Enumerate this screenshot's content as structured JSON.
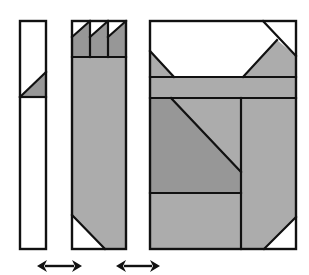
{
  "diagram": {
    "title": "Quilt block assembly diagram",
    "width": 309,
    "height": 275,
    "colors": {
      "background": "#ffffff",
      "outline": "#111111",
      "white_fabric": "#ffffff",
      "light_gray": "#acacac",
      "dark_gray": "#979797",
      "arrow": "#111111"
    },
    "units": [
      {
        "name": "left-strip-unit",
        "outline": [
          20,
          21,
          26,
          228
        ],
        "polygons": [
          {
            "fill": "white_fabric",
            "points": "20,21 46,21 46,72 20,97"
          },
          {
            "fill": "dark_gray",
            "points": "20,97 46,72 46,97"
          },
          {
            "fill": "white_fabric",
            "points": "20,97 46,97 46,249 20,249"
          }
        ],
        "lines": [
          [
            20,
            97,
            46,
            72
          ],
          [
            20,
            97,
            46,
            97
          ]
        ]
      },
      {
        "name": "middle-strip-unit",
        "outline": [
          72,
          21,
          54,
          228
        ],
        "polygons": [
          {
            "fill": "white_fabric",
            "points": "72,21 90,21 72,37"
          },
          {
            "fill": "dark_gray",
            "points": "90,21 90,57 72,57 72,37"
          },
          {
            "fill": "white_fabric",
            "points": "90,21 108,21 90,37"
          },
          {
            "fill": "dark_gray",
            "points": "108,21 108,57 90,57 90,37"
          },
          {
            "fill": "white_fabric",
            "points": "108,21 126,21 108,37"
          },
          {
            "fill": "dark_gray",
            "points": "126,21 126,57 108,57 108,37"
          },
          {
            "fill": "light_gray",
            "points": "72,57 126,57 126,249 105,249 72,215"
          },
          {
            "fill": "white_fabric",
            "points": "72,215 105,249 72,249"
          }
        ],
        "lines": [
          [
            72,
            37,
            90,
            21
          ],
          [
            90,
            37,
            108,
            21
          ],
          [
            108,
            37,
            126,
            21
          ],
          [
            90,
            21,
            90,
            57
          ],
          [
            108,
            21,
            108,
            57
          ],
          [
            72,
            57,
            126,
            57
          ],
          [
            72,
            215,
            105,
            249
          ]
        ]
      },
      {
        "name": "right-block-unit",
        "outline": [
          150,
          21,
          146,
          228
        ],
        "polygons": [
          {
            "fill": "white_fabric",
            "points": "150,21 296,21 296,77 150,77"
          },
          {
            "fill": "light_gray",
            "points": "150,51 174,77 150,77"
          },
          {
            "fill": "light_gray",
            "points": "277,40 296,56 296,77 243,77"
          },
          {
            "fill": "white_fabric",
            "points": "263,21 296,21 296,56"
          },
          {
            "fill": "light_gray",
            "points": "150,77 296,77 296,98 150,98"
          },
          {
            "fill": "light_gray",
            "points": "171,98 241,98 241,172"
          },
          {
            "fill": "dark_gray",
            "points": "150,98 171,98 241,172 241,193 150,193"
          },
          {
            "fill": "light_gray",
            "points": "150,193 241,193 241,249 150,249"
          },
          {
            "fill": "light_gray",
            "points": "241,98 296,98 296,217 264,249 241,249"
          },
          {
            "fill": "white_fabric",
            "points": "296,217 296,249 264,249"
          }
        ],
        "lines": [
          [
            150,
            51,
            174,
            77
          ],
          [
            243,
            77,
            277,
            40
          ],
          [
            263,
            21,
            296,
            56
          ],
          [
            150,
            77,
            296,
            77
          ],
          [
            150,
            98,
            296,
            98
          ],
          [
            171,
            98,
            241,
            172
          ],
          [
            241,
            98,
            241,
            249
          ],
          [
            150,
            193,
            241,
            193
          ],
          [
            264,
            249,
            296,
            217
          ]
        ]
      }
    ],
    "arrows": [
      {
        "name": "double-arrow-left-to-middle",
        "x1": 37,
        "x2": 82,
        "y": 266
      },
      {
        "name": "double-arrow-middle-to-right",
        "x1": 116,
        "x2": 160,
        "y": 266
      }
    ]
  }
}
